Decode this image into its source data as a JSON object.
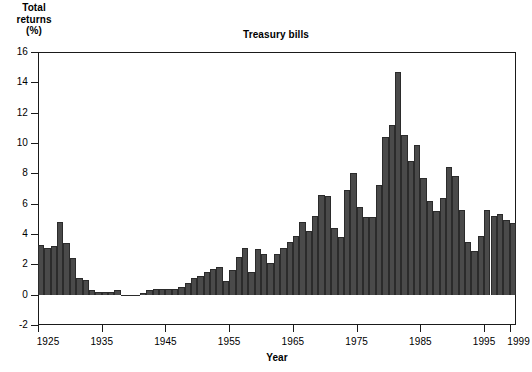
{
  "chart_data": {
    "type": "bar",
    "title": "Treasury bills",
    "xlabel": "Year",
    "ylabel": "Total returns (%)",
    "ylabel_lines": [
      "Total",
      "returns",
      "(%)"
    ],
    "grid": false,
    "legend": null,
    "ylim": [
      -2,
      16
    ],
    "ytick_values": [
      -2,
      0,
      2,
      4,
      6,
      8,
      10,
      12,
      14,
      16
    ],
    "ytick_labels": [
      "-2",
      "0",
      "2",
      "4",
      "6",
      "8",
      "10",
      "12",
      "14",
      "16"
    ],
    "xlim": [
      1925,
      1999
    ],
    "xtick_values": [
      1925,
      1935,
      1945,
      1955,
      1965,
      1975,
      1985,
      1995,
      1999
    ],
    "xtick_labels": [
      "1925",
      "1935",
      "1945",
      "1955",
      "1965",
      "1975",
      "1985",
      "1995",
      "1999"
    ],
    "bar_color": "#4a4a4a",
    "bar_edge_color": "#2b2b2b",
    "axis_color": "#1a1a1a",
    "background_color": "#ffffff",
    "categories": [
      1925,
      1926,
      1927,
      1928,
      1929,
      1930,
      1931,
      1932,
      1933,
      1934,
      1935,
      1936,
      1937,
      1938,
      1939,
      1940,
      1941,
      1942,
      1943,
      1944,
      1945,
      1946,
      1947,
      1948,
      1949,
      1950,
      1951,
      1952,
      1953,
      1954,
      1955,
      1956,
      1957,
      1958,
      1959,
      1960,
      1961,
      1962,
      1963,
      1964,
      1965,
      1966,
      1967,
      1968,
      1969,
      1970,
      1971,
      1972,
      1973,
      1974,
      1975,
      1976,
      1977,
      1978,
      1979,
      1980,
      1981,
      1982,
      1983,
      1984,
      1985,
      1986,
      1987,
      1988,
      1989,
      1990,
      1991,
      1992,
      1993,
      1994,
      1995,
      1996,
      1997,
      1998,
      1999
    ],
    "values": [
      3.3,
      3.1,
      3.2,
      4.8,
      3.4,
      2.4,
      1.1,
      1.0,
      0.3,
      0.2,
      0.2,
      0.2,
      0.3,
      0.0,
      0.0,
      0.0,
      0.1,
      0.3,
      0.4,
      0.4,
      0.4,
      0.4,
      0.5,
      0.8,
      1.1,
      1.2,
      1.5,
      1.7,
      1.8,
      0.9,
      1.6,
      2.5,
      3.1,
      1.5,
      3.0,
      2.7,
      2.1,
      2.7,
      3.1,
      3.5,
      3.9,
      4.8,
      4.2,
      5.2,
      6.6,
      6.5,
      4.4,
      3.8,
      6.9,
      8.0,
      5.8,
      5.1,
      5.1,
      7.2,
      10.4,
      11.2,
      14.7,
      10.5,
      8.8,
      9.9,
      7.7,
      6.2,
      5.5,
      6.4,
      8.4,
      7.8,
      5.6,
      3.5,
      2.9,
      3.9,
      5.6,
      5.2,
      5.3,
      4.9,
      4.7
    ]
  }
}
